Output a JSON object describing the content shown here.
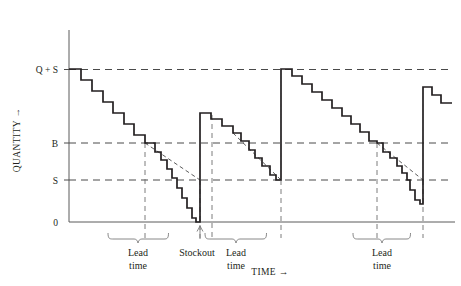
{
  "figure": {
    "name": "inventory-sawtooth-chart"
  },
  "chart_data": {
    "type": "line",
    "title": "",
    "subtitle": "",
    "xlabel": "TIME →",
    "ylabel": "QUANTITY →",
    "grid": true,
    "legend": null,
    "axis": {
      "x_label": "TIME →",
      "y_label": "QUANTITY →",
      "x_range": [
        0,
        100
      ],
      "y_range": [
        0,
        1.12
      ],
      "x_origin_px": 69,
      "x_end_px": 455,
      "y_origin_px": 222,
      "y_top_px": 30
    },
    "y_tick_labels": [
      "Q + S",
      "B",
      "S",
      "0"
    ],
    "y_tick_values": [
      1.0,
      0.52,
      0.275,
      0.0
    ],
    "y_tick_px": [
      69.5,
      143,
      180,
      222
    ],
    "reference_lines": [
      {
        "label": "Q + S",
        "value": 1.0,
        "style": "dashed"
      },
      {
        "label": "B",
        "value": 0.52,
        "style": "dashed"
      },
      {
        "label": "S",
        "value": 0.275,
        "style": "dashed"
      },
      {
        "label": "0",
        "value": 0.0,
        "style": "solid-axis"
      }
    ],
    "series": [
      {
        "name": "inventory-on-hand",
        "style": "staircase",
        "description": "Stepwise depletion of inventory with instantaneous replenishments",
        "points_px": [
          [
            69,
            69
          ],
          [
            81,
            69
          ],
          [
            81,
            80
          ],
          [
            92,
            80
          ],
          [
            92,
            91
          ],
          [
            103,
            91
          ],
          [
            103,
            102
          ],
          [
            113,
            102
          ],
          [
            113,
            113
          ],
          [
            124,
            113
          ],
          [
            124,
            124
          ],
          [
            134,
            124
          ],
          [
            134,
            135
          ],
          [
            145,
            135
          ],
          [
            145,
            143
          ],
          [
            155,
            143
          ],
          [
            155,
            152
          ],
          [
            161,
            152
          ],
          [
            161,
            160
          ],
          [
            167,
            160
          ],
          [
            167,
            169
          ],
          [
            172,
            169
          ],
          [
            172,
            178
          ],
          [
            177,
            178
          ],
          [
            177,
            188
          ],
          [
            182,
            188
          ],
          [
            182,
            198
          ],
          [
            187,
            198
          ],
          [
            187,
            208
          ],
          [
            192,
            208
          ],
          [
            192,
            218
          ],
          [
            196,
            218
          ],
          [
            196,
            222
          ],
          [
            200,
            222
          ],
          [
            200,
            113
          ],
          [
            211,
            113
          ],
          [
            211,
            119
          ],
          [
            222,
            119
          ],
          [
            222,
            126
          ],
          [
            233,
            126
          ],
          [
            233,
            133
          ],
          [
            241,
            133
          ],
          [
            241,
            141
          ],
          [
            249,
            141
          ],
          [
            249,
            150
          ],
          [
            255,
            150
          ],
          [
            255,
            158
          ],
          [
            262,
            158
          ],
          [
            262,
            166
          ],
          [
            270,
            166
          ],
          [
            270,
            175
          ],
          [
            276,
            175
          ],
          [
            276,
            180
          ],
          [
            281,
            180
          ],
          [
            281,
            69
          ],
          [
            292,
            69
          ],
          [
            292,
            76
          ],
          [
            302,
            76
          ],
          [
            302,
            84
          ],
          [
            312,
            84
          ],
          [
            312,
            92
          ],
          [
            322,
            92
          ],
          [
            322,
            100
          ],
          [
            332,
            100
          ],
          [
            332,
            108
          ],
          [
            342,
            108
          ],
          [
            342,
            116
          ],
          [
            351,
            116
          ],
          [
            351,
            124
          ],
          [
            360,
            124
          ],
          [
            360,
            132
          ],
          [
            369,
            132
          ],
          [
            369,
            141
          ],
          [
            377,
            141
          ],
          [
            377,
            143
          ],
          [
            383,
            143
          ],
          [
            383,
            152
          ],
          [
            390,
            152
          ],
          [
            390,
            158
          ],
          [
            397,
            158
          ],
          [
            397,
            166
          ],
          [
            402,
            166
          ],
          [
            402,
            173
          ],
          [
            407,
            173
          ],
          [
            407,
            180
          ],
          [
            410,
            180
          ],
          [
            410,
            190
          ],
          [
            415,
            190
          ],
          [
            415,
            200
          ],
          [
            420,
            200
          ],
          [
            420,
            204
          ],
          [
            423,
            204
          ],
          [
            423,
            87
          ],
          [
            432,
            87
          ],
          [
            432,
            95
          ],
          [
            441,
            95
          ],
          [
            441,
            103
          ],
          [
            452,
            103
          ]
        ]
      }
    ],
    "dashed_forecast_lines": [
      {
        "name": "lead-time-projection-1",
        "from_px": [
          145,
          143
        ],
        "to_px": [
          200,
          180
        ],
        "style": "dashed"
      },
      {
        "name": "lead-time-projection-2",
        "from_px": [
          233,
          133
        ],
        "to_px": [
          281,
          180
        ],
        "style": "dashed"
      },
      {
        "name": "lead-time-projection-3",
        "from_px": [
          377,
          143
        ],
        "to_px": [
          423,
          180
        ],
        "style": "dashed"
      }
    ],
    "vertical_markers_px": [
      145,
      200,
      212,
      281,
      377,
      423
    ],
    "annotations": [
      {
        "name": "lead-time-1",
        "label_lines": [
          "Lead",
          "time"
        ],
        "brace_start_px": 145,
        "brace_end_px": 200,
        "label_center_px": 172
      },
      {
        "name": "stockout",
        "label_lines": [
          "Stockout"
        ],
        "pointer_px": 201,
        "label_center_px": 209
      },
      {
        "name": "lead-time-2",
        "label_lines": [
          "Lead",
          "time"
        ],
        "brace_start_px": 212,
        "brace_end_px": 281,
        "label_center_px": 246
      },
      {
        "name": "lead-time-3",
        "label_lines": [
          "Lead",
          "time"
        ],
        "brace_start_px": 353,
        "brace_end_px": 410,
        "label_center_px": 381
      }
    ]
  },
  "labels": {
    "y_tick_q_plus_s": "Q + S",
    "y_tick_b": "B",
    "y_tick_s": "S",
    "y_tick_zero": "0",
    "y_axis_title": "QUANTITY →",
    "x_axis_title": "TIME →",
    "lead_time_line1": "Lead",
    "lead_time_line2": "time",
    "stockout": "Stockout"
  },
  "colors": {
    "ink": "#231f20",
    "grid": "#6e6e6e",
    "background": "#ffffff"
  }
}
